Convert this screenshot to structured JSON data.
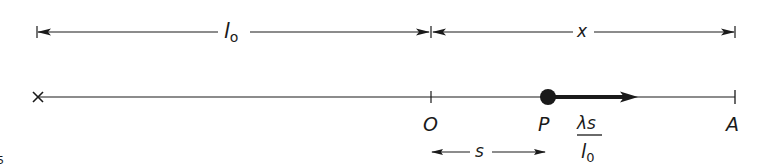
{
  "diagram": {
    "type": "one-dimensional displacement diagram",
    "top_dimension": {
      "segments": [
        {
          "label": "l",
          "subscript": "o",
          "from": "left end",
          "to": "O"
        },
        {
          "label": "x",
          "from": "O",
          "to": "A"
        }
      ]
    },
    "main_line": {
      "left_end_marker": "×",
      "points": [
        {
          "label": "O",
          "marker": "tick"
        },
        {
          "label": "P",
          "marker": "filled-dot"
        },
        {
          "label": "A",
          "marker": "tick"
        }
      ],
      "force_vector": {
        "from": "P",
        "direction": "toward A",
        "label_numerator": "λs",
        "label_denominator": "l",
        "label_denominator_subscript": "0"
      }
    },
    "bottom_dimension": {
      "label": "s",
      "from": "O",
      "to": "P"
    },
    "corner_text": "5"
  }
}
